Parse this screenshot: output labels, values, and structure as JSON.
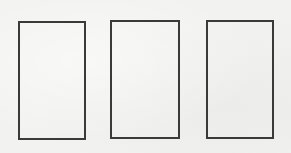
{
  "canvas": {
    "background": "#f2f2f0",
    "width": 291,
    "height": 153
  },
  "boxes": [
    {
      "id": "box-1",
      "left": 18,
      "top": 21,
      "width": 68,
      "height": 119,
      "border_color": "#3a3a3a"
    },
    {
      "id": "box-2",
      "left": 110,
      "top": 20,
      "width": 70,
      "height": 119,
      "border_color": "#3a3a3a"
    },
    {
      "id": "box-3",
      "left": 206,
      "top": 20,
      "width": 68,
      "height": 119,
      "border_color": "#3a3a3a"
    }
  ]
}
